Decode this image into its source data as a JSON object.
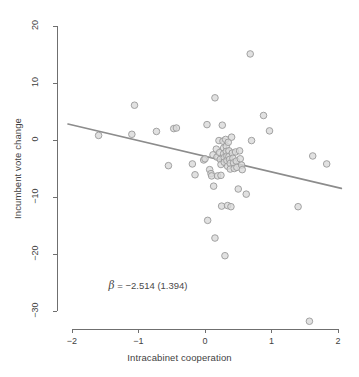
{
  "figure": {
    "title_partial": "",
    "background": "#ffffff"
  },
  "annotation": {
    "beta_symbol": "β",
    "beta_text": " = −2.514 (1.394)",
    "full_text": "β = −2.514 (1.394)",
    "coefficient": -2.514,
    "std_error": 1.394,
    "x_position": -1.45,
    "y_position": -25.5
  },
  "style": {
    "point_fill": "#d9d9d9",
    "point_stroke": "#9a9a9a",
    "line_color": "#8c8c8c",
    "axis_color": "#6f6f6f",
    "text_color": "#3f3f3f"
  },
  "chart_data": {
    "type": "scatter",
    "title": "",
    "xlabel": "Intracabinet cooperation",
    "ylabel": "Incumbent vote change",
    "xlim": [
      -2.15,
      2.1
    ],
    "ylim": [
      -33.5,
      21.5
    ],
    "xticks": [
      -2,
      -1,
      0,
      1,
      2
    ],
    "xtick_labels": [
      "−2",
      "−1",
      "0",
      "1",
      "2"
    ],
    "yticks": [
      20,
      10,
      0,
      -10,
      -20,
      -30
    ],
    "ytick_labels": [
      "20",
      "10",
      "0",
      "−10",
      "−20",
      "−30"
    ],
    "grid": false,
    "legend": null,
    "points": [
      [
        -1.6,
        0.8
      ],
      [
        -1.06,
        6.1
      ],
      [
        -1.1,
        1.0
      ],
      [
        -0.73,
        1.5
      ],
      [
        -0.55,
        -4.5
      ],
      [
        -0.47,
        2.0
      ],
      [
        -0.43,
        2.1
      ],
      [
        -0.19,
        -4.2
      ],
      [
        -0.15,
        -6.1
      ],
      [
        -0.02,
        -3.5
      ],
      [
        0.0,
        -3.3
      ],
      [
        0.03,
        2.7
      ],
      [
        0.04,
        -14.1
      ],
      [
        0.07,
        -5.2
      ],
      [
        0.09,
        -5.9
      ],
      [
        0.1,
        -6.3
      ],
      [
        0.12,
        -2.6
      ],
      [
        0.13,
        -8.1
      ],
      [
        0.15,
        7.4
      ],
      [
        0.15,
        -17.2
      ],
      [
        0.17,
        -1.6
      ],
      [
        0.18,
        -3.0
      ],
      [
        0.19,
        -6.3
      ],
      [
        0.21,
        -0.1
      ],
      [
        0.22,
        -2.2
      ],
      [
        0.23,
        -3.4
      ],
      [
        0.24,
        -4.3
      ],
      [
        0.24,
        -6.2
      ],
      [
        0.25,
        -11.6
      ],
      [
        0.26,
        2.6
      ],
      [
        0.27,
        -0.2
      ],
      [
        0.28,
        -1.4
      ],
      [
        0.28,
        -2.4
      ],
      [
        0.29,
        -3.1
      ],
      [
        0.29,
        -3.9
      ],
      [
        0.3,
        -20.3
      ],
      [
        0.31,
        0.1
      ],
      [
        0.32,
        -1.1
      ],
      [
        0.32,
        -2.0
      ],
      [
        0.33,
        -2.8
      ],
      [
        0.33,
        -3.6
      ],
      [
        0.34,
        -4.6
      ],
      [
        0.34,
        -11.5
      ],
      [
        0.35,
        -0.4
      ],
      [
        0.36,
        -1.9
      ],
      [
        0.36,
        -2.9
      ],
      [
        0.37,
        -3.4
      ],
      [
        0.38,
        -4.1
      ],
      [
        0.38,
        -5.1
      ],
      [
        0.39,
        -11.7
      ],
      [
        0.4,
        0.5
      ],
      [
        0.41,
        -2.3
      ],
      [
        0.42,
        -3.2
      ],
      [
        0.43,
        -4.0
      ],
      [
        0.44,
        -5.0
      ],
      [
        0.46,
        -2.1
      ],
      [
        0.47,
        -3.7
      ],
      [
        0.48,
        -4.8
      ],
      [
        0.5,
        -8.6
      ],
      [
        0.52,
        -1.9
      ],
      [
        0.53,
        -3.3
      ],
      [
        0.55,
        -4.4
      ],
      [
        0.56,
        -5.2
      ],
      [
        0.62,
        -9.5
      ],
      [
        0.68,
        15.1
      ],
      [
        0.7,
        -0.1
      ],
      [
        0.88,
        4.3
      ],
      [
        0.97,
        1.6
      ],
      [
        1.4,
        -11.7
      ],
      [
        1.57,
        -31.8
      ],
      [
        1.62,
        -2.8
      ],
      [
        1.83,
        -4.2
      ]
    ],
    "regression_line": {
      "x_start": -2.06,
      "y_start": 2.8,
      "x_end": 2.05,
      "y_end": -8.5,
      "slope": -2.514,
      "color": "#8c8c8c"
    }
  }
}
